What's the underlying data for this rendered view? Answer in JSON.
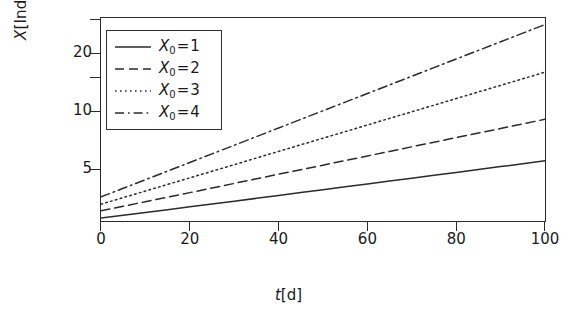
{
  "chart_data": {
    "type": "line",
    "title": "",
    "subtitle": "",
    "xlabel": "t[d]",
    "ylabel": "X[Indiv]",
    "xlabel_italic_part": "t",
    "xlabel_rest": "[d]",
    "ylabel_italic_part": "X",
    "ylabel_rest": "[Indiv]",
    "x_scale": "linear",
    "y_scale": "log",
    "xlim": [
      0,
      100
    ],
    "ylim": [
      2.7,
      30.5
    ],
    "grid": false,
    "legend_position": "upper-left",
    "x_ticks": [
      0,
      20,
      40,
      60,
      80,
      100
    ],
    "x_tick_labels": [
      "0",
      "20",
      "40",
      "60",
      "80",
      "100"
    ],
    "y_ticks": [
      5,
      10,
      15,
      20,
      30
    ],
    "y_tick_labels": [
      "5",
      "10",
      "",
      "20",
      ""
    ],
    "y_labeled_ticks": [
      {
        "value": 5,
        "label": "5"
      },
      {
        "value": 10,
        "label": "10"
      },
      {
        "value": 20,
        "label": "20"
      }
    ],
    "x": [
      0,
      5,
      10,
      15,
      20,
      25,
      30,
      35,
      40,
      45,
      50,
      55,
      60,
      65,
      70,
      75,
      80,
      85,
      90,
      95,
      100
    ],
    "series": [
      {
        "name": "X_0 = 1",
        "legend_label_base": "X",
        "legend_label_sub": "0",
        "legend_label_value": "1",
        "linestyle": "solid",
        "color": "#2b2b2b",
        "x0": 1,
        "values": [
          2.8,
          2.89,
          2.99,
          3.09,
          3.2,
          3.31,
          3.42,
          3.54,
          3.66,
          3.79,
          3.92,
          4.06,
          4.2,
          4.35,
          4.5,
          4.66,
          4.82,
          4.99,
          5.17,
          5.35,
          5.54
        ]
      },
      {
        "name": "X_0 = 2",
        "legend_label_base": "X",
        "legend_label_sub": "0",
        "legend_label_value": "2",
        "linestyle": "dashed",
        "color": "#2b2b2b",
        "x0": 2,
        "values": [
          3.05,
          3.22,
          3.4,
          3.59,
          3.79,
          4.0,
          4.23,
          4.47,
          4.72,
          4.98,
          5.26,
          5.56,
          5.87,
          6.2,
          6.55,
          6.92,
          7.31,
          7.72,
          8.15,
          8.61,
          9.1
        ]
      },
      {
        "name": "X_0 = 3",
        "legend_label_base": "X",
        "legend_label_sub": "0",
        "legend_label_value": "3",
        "linestyle": "dotted",
        "color": "#2b2b2b",
        "x0": 3,
        "values": [
          3.3,
          3.57,
          3.86,
          4.18,
          4.52,
          4.89,
          5.29,
          5.73,
          6.2,
          6.71,
          7.26,
          7.85,
          8.5,
          9.2,
          9.95,
          10.77,
          11.65,
          12.61,
          13.64,
          14.76,
          15.97
        ]
      },
      {
        "name": "X_0 = 4",
        "legend_label_base": "X",
        "legend_label_sub": "0",
        "legend_label_value": "4",
        "linestyle": "dashdot",
        "color": "#2b2b2b",
        "x0": 4,
        "values": [
          3.6,
          3.99,
          4.42,
          4.9,
          5.43,
          6.02,
          6.67,
          7.4,
          8.2,
          9.09,
          10.07,
          11.17,
          12.38,
          13.72,
          15.21,
          16.86,
          18.69,
          20.71,
          22.96,
          25.45,
          28.21
        ]
      }
    ]
  }
}
